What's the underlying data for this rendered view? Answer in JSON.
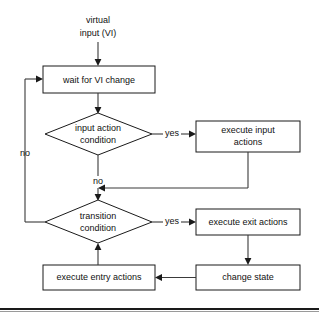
{
  "diagram": {
    "background_color": "#ffffff",
    "line_color": "#3a3a3a",
    "text_color": "#111111",
    "source": {
      "line1": "virtual",
      "line2": "input (VI)"
    },
    "nodes": [
      {
        "id": "wait",
        "shape": "box",
        "line1": "wait for VI change",
        "line2": ""
      },
      {
        "id": "input_action_condition",
        "shape": "diamond",
        "line1": "input action",
        "line2": "condition"
      },
      {
        "id": "execute_input_actions",
        "shape": "box",
        "line1": "execute input",
        "line2": "actions"
      },
      {
        "id": "transition_condition",
        "shape": "diamond",
        "line1": "transition",
        "line2": "condition"
      },
      {
        "id": "execute_exit_actions",
        "shape": "box",
        "line1": "execute exit actions",
        "line2": ""
      },
      {
        "id": "change_state",
        "shape": "box",
        "line1": "change state",
        "line2": ""
      },
      {
        "id": "execute_entry_actions",
        "shape": "box",
        "line1": "execute entry actions",
        "line2": ""
      }
    ],
    "edge_labels": {
      "yes_input": "yes",
      "no_input": "no",
      "yes_transition": "yes",
      "no_transition": "no"
    }
  }
}
